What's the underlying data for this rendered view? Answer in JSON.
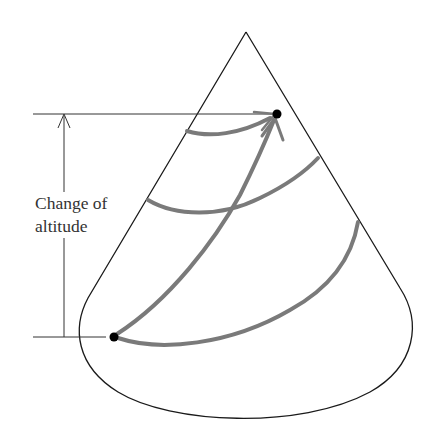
{
  "figure": {
    "label": {
      "line1": "Change of",
      "line2": "altitude"
    },
    "colors": {
      "outline": "#1a1a1a",
      "path": "#7a7a7a",
      "dot": "#000000",
      "background": "#ffffff"
    },
    "elements": [
      "cone-outline",
      "altitude-dimension-line",
      "spiral-path-segments",
      "direct-path-arrow",
      "start-point",
      "end-point"
    ]
  }
}
